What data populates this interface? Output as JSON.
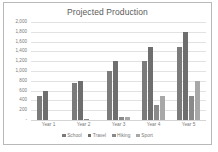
{
  "chart_data": {
    "type": "bar",
    "title": "Projected Production",
    "xlabel": "",
    "ylabel": "",
    "categories": [
      "Year 1",
      "Year 2",
      "Year 3",
      "Year 4",
      "Year 5"
    ],
    "series": [
      {
        "name": "School",
        "color": "#7b7b7b",
        "values": [
          500,
          750,
          1000,
          1200,
          1500
        ]
      },
      {
        "name": "Travel",
        "color": "#6e6e6e",
        "values": [
          600,
          800,
          1200,
          1500,
          1800
        ]
      },
      {
        "name": "Hiking",
        "color": "#8a8a8a",
        "values": [
          0,
          20,
          60,
          300,
          500
        ]
      },
      {
        "name": "Sport",
        "color": "#a8a8a8",
        "values": [
          0,
          0,
          60,
          500,
          800
        ]
      }
    ],
    "ylim": [
      0,
      2000
    ],
    "y_ticks": [
      {
        "value": 2000,
        "label": "2,000"
      },
      {
        "value": 1800,
        "label": "1,800"
      },
      {
        "value": 1600,
        "label": "1,600"
      },
      {
        "value": 1400,
        "label": "1,400"
      },
      {
        "value": 1200,
        "label": "1,200"
      },
      {
        "value": 1000,
        "label": "1,000"
      },
      {
        "value": 800,
        "label": "800"
      },
      {
        "value": 600,
        "label": "600"
      },
      {
        "value": 400,
        "label": "400"
      },
      {
        "value": 200,
        "label": "200"
      },
      {
        "value": 0,
        "label": "-"
      }
    ],
    "grid": true,
    "legend_position": "bottom"
  }
}
